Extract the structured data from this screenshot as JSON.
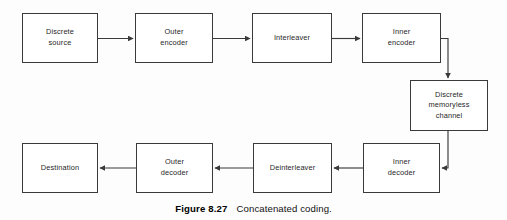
{
  "figure": {
    "caption_number": "Figure 8.27",
    "caption_text": "Concatenated coding.",
    "line_color": "#3a3a3a",
    "box_fill": "#ffffff",
    "background": "#fdfdfd"
  },
  "blocks": [
    {
      "id": "discrete-source",
      "label": "Discrete\nsource",
      "x": 22,
      "y": 13,
      "w": 76,
      "h": 50
    },
    {
      "id": "outer-encoder",
      "label": "Outer\nencoder",
      "x": 135,
      "y": 13,
      "w": 78,
      "h": 50
    },
    {
      "id": "interleaver",
      "label": "Interleaver",
      "x": 252,
      "y": 13,
      "w": 80,
      "h": 50
    },
    {
      "id": "inner-encoder",
      "label": "Inner\nencoder",
      "x": 362,
      "y": 13,
      "w": 79,
      "h": 50
    },
    {
      "id": "discrete-memoryless-channel",
      "label": "Discrete\nmemoryless\nchannel",
      "x": 410,
      "y": 80,
      "w": 78,
      "h": 51
    },
    {
      "id": "inner-decoder",
      "label": "Inner\ndecoder",
      "x": 363,
      "y": 143,
      "w": 77,
      "h": 50
    },
    {
      "id": "deinterleaver",
      "label": "Deinterleaver",
      "x": 253,
      "y": 143,
      "w": 79,
      "h": 50
    },
    {
      "id": "outer-decoder",
      "label": "Outer\ndecoder",
      "x": 136,
      "y": 143,
      "w": 77,
      "h": 50
    },
    {
      "id": "destination",
      "label": "Destination",
      "x": 22,
      "y": 143,
      "w": 76,
      "h": 50
    }
  ],
  "connectors": [
    {
      "id": "source-to-outer-encoder",
      "from": "discrete-source",
      "to": "outer-encoder",
      "direction": "right"
    },
    {
      "id": "outer-encoder-to-interleaver",
      "from": "outer-encoder",
      "to": "interleaver",
      "direction": "right"
    },
    {
      "id": "interleaver-to-inner-encoder",
      "from": "interleaver",
      "to": "inner-encoder",
      "direction": "right"
    },
    {
      "id": "inner-encoder-to-channel",
      "from": "inner-encoder",
      "to": "discrete-memoryless-channel",
      "direction": "down"
    },
    {
      "id": "channel-to-inner-decoder",
      "from": "discrete-memoryless-channel",
      "to": "inner-decoder",
      "direction": "left"
    },
    {
      "id": "inner-decoder-to-deinterleaver",
      "from": "inner-decoder",
      "to": "deinterleaver",
      "direction": "left"
    },
    {
      "id": "deinterleaver-to-outer-decoder",
      "from": "deinterleaver",
      "to": "outer-decoder",
      "direction": "left"
    },
    {
      "id": "outer-decoder-to-destination",
      "from": "outer-decoder",
      "to": "destination",
      "direction": "left"
    }
  ]
}
